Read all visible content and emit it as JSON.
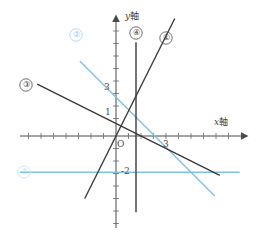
{
  "figure": {
    "kind": "coordinate-plane-line-graph",
    "background": "#ffffff",
    "width": 274,
    "height": 249
  },
  "axes": {
    "y_axis_label": "y 軸",
    "y_axis_label_italic": "y",
    "y_axis_label_cjk": "軸",
    "x_axis_label": "x 軸",
    "x_axis_label_italic": "x",
    "x_axis_label_cjk": "軸",
    "origin_label": "O",
    "axis_color": "#4a4a4a",
    "y_ticks_labeled": [
      "3",
      "1",
      "-2"
    ],
    "x_ticks_labeled": [
      "3"
    ]
  },
  "tick_labels": {
    "y3": "3",
    "y1": "1",
    "ym2": "-2",
    "x3": "3",
    "origin": "O"
  },
  "markers": {
    "one": "①",
    "two": "②",
    "three": "③",
    "four": "④",
    "five": "⑤"
  },
  "colors": {
    "dark_line": "#3a3a3a",
    "blue_line": "#7ec2e4",
    "blue_faint": "#a9d7ec",
    "axis": "#4a4a4a",
    "text": "#3f3f3f"
  },
  "chart_data": {
    "type": "line",
    "title": "",
    "xlabel": "x 軸",
    "ylabel": "y 軸",
    "xlim": [
      -7.7,
      10.3
    ],
    "ylim": [
      -7.4,
      9.4
    ],
    "grid": false,
    "legend": "inline-circled-numbers",
    "origin_px": [
      116,
      136
    ],
    "unit_px": 12.5,
    "series": [
      {
        "name": "①",
        "label": "①",
        "color": "#3a3a3a",
        "slope": 2.0,
        "intercept": 0.0,
        "x_range": [
          -2.5,
          4.7
        ],
        "label_pos": [
          5.0,
          6.6
        ]
      },
      {
        "name": "②",
        "label": "②",
        "color": "#7ec2e4",
        "slope": -1.0,
        "intercept": 3.1,
        "x_range": [
          -2.9,
          7.9
        ],
        "label_pos": [
          -3.2,
          8.0
        ]
      },
      {
        "name": "③",
        "label": "③",
        "color": "#3a3a3a",
        "slope": -0.5,
        "intercept": 1.0,
        "x_range": [
          -6.3,
          8.3
        ],
        "label_pos": [
          -7.2,
          4.1
        ]
      },
      {
        "name": "④",
        "label": "④",
        "color": "#3a3a3a",
        "vertical_x": 1.6,
        "y_range": [
          -6.1,
          7.5
        ],
        "label_pos": [
          1.5,
          8.2
        ]
      },
      {
        "name": "⑤",
        "label": "⑤",
        "color": "#7ec2e4",
        "horizontal_y": -2.9,
        "x_range": [
          -7.7,
          9.9
        ],
        "label_pos": [
          -7.4,
          -2.9
        ]
      }
    ]
  }
}
